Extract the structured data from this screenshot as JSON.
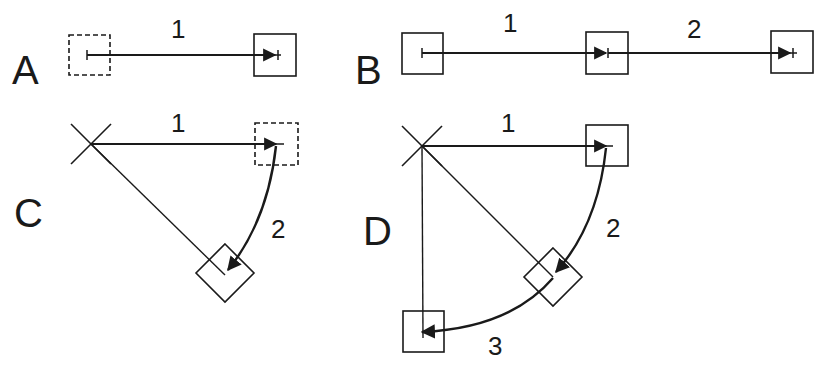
{
  "panels": {
    "A": {
      "label": "A",
      "steps": [
        "1"
      ]
    },
    "B": {
      "label": "B",
      "steps": [
        "1",
        "2"
      ]
    },
    "C": {
      "label": "C",
      "steps": [
        "1",
        "2"
      ]
    },
    "D": {
      "label": "D",
      "steps": [
        "1",
        "2",
        "3"
      ]
    }
  },
  "colors": {
    "stroke": "#1a1a1a",
    "background": "#ffffff"
  }
}
